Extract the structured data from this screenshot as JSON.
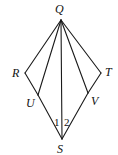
{
  "diagram": {
    "points": {
      "Q": {
        "label": "Q",
        "x": 61,
        "y": 20,
        "lx": 55,
        "ly": 13
      },
      "R": {
        "label": "R",
        "x": 25,
        "y": 73,
        "lx": 12,
        "ly": 77
      },
      "T": {
        "label": "T",
        "x": 101,
        "y": 73,
        "lx": 105,
        "ly": 76
      },
      "U": {
        "label": "U",
        "x": 38,
        "y": 95,
        "lx": 26,
        "ly": 107
      },
      "V": {
        "label": "V",
        "x": 88,
        "y": 93,
        "lx": 91,
        "ly": 105
      },
      "S": {
        "label": "S",
        "x": 62,
        "y": 139,
        "lx": 57,
        "ly": 153
      }
    },
    "segments": [
      [
        "Q",
        "R"
      ],
      [
        "Q",
        "U"
      ],
      [
        "Q",
        "S"
      ],
      [
        "Q",
        "V"
      ],
      [
        "Q",
        "T"
      ],
      [
        "R",
        "U"
      ],
      [
        "U",
        "S"
      ],
      [
        "T",
        "V"
      ],
      [
        "V",
        "S"
      ]
    ],
    "angle_labels": [
      {
        "text": "1",
        "x": 54,
        "y": 126
      },
      {
        "text": "2",
        "x": 64,
        "y": 126
      }
    ]
  }
}
